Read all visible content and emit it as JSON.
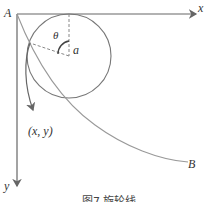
{
  "figure": {
    "caption": "图7 旋轮线",
    "labels": {
      "origin": "A",
      "x_axis": "x",
      "y_axis": "y",
      "angle": "θ",
      "radius": "a",
      "point": "(x, y)",
      "end": "B"
    },
    "colors": {
      "axis": "#666666",
      "circle": "#777777",
      "curve": "#999999",
      "dashed": "#888888"
    }
  }
}
